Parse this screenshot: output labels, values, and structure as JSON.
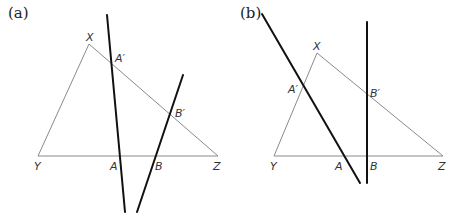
{
  "panels": [
    {
      "id": "a",
      "label": "(a)",
      "label_pos": [
        8,
        18
      ],
      "triangle": {
        "X": [
          89,
          44
        ],
        "Y": [
          38,
          156
        ],
        "Z": [
          218,
          156
        ]
      },
      "lines": [
        {
          "name": "line-through-A-Aprime",
          "from": [
            107,
            15
          ],
          "to": [
            125,
            212
          ]
        },
        {
          "name": "line-through-B-Bprime",
          "from": [
            183,
            75
          ],
          "to": [
            137,
            212
          ]
        }
      ],
      "points": [
        {
          "name": "X",
          "text": "X",
          "pos": [
            86,
            41
          ]
        },
        {
          "name": "Y",
          "text": "Y",
          "pos": [
            34,
            170
          ]
        },
        {
          "name": "Z",
          "text": "Z",
          "pos": [
            213,
            170
          ]
        },
        {
          "name": "A-prime",
          "text": "A′",
          "pos": [
            115,
            62
          ]
        },
        {
          "name": "B-prime",
          "text": "B′",
          "pos": [
            175,
            117
          ]
        },
        {
          "name": "A",
          "text": "A",
          "pos": [
            110,
            170
          ]
        },
        {
          "name": "B",
          "text": "B",
          "pos": [
            155,
            170
          ]
        }
      ]
    },
    {
      "id": "b",
      "label": "(b)",
      "label_pos": [
        240,
        18
      ],
      "triangle": {
        "X": [
          317,
          53
        ],
        "Y": [
          274,
          156
        ],
        "Z": [
          443,
          156
        ]
      },
      "lines": [
        {
          "name": "line-through-A-Aprime",
          "from": [
            262,
            14
          ],
          "to": [
            360,
            183
          ]
        },
        {
          "name": "line-through-B-Bprime",
          "from": [
            367,
            22
          ],
          "to": [
            367,
            183
          ]
        }
      ],
      "points": [
        {
          "name": "X",
          "text": "X",
          "pos": [
            313,
            50
          ]
        },
        {
          "name": "Y",
          "text": "Y",
          "pos": [
            270,
            170
          ]
        },
        {
          "name": "Z",
          "text": "Z",
          "pos": [
            438,
            170
          ]
        },
        {
          "name": "A-prime",
          "text": "A′",
          "pos": [
            288,
            93
          ]
        },
        {
          "name": "B-prime",
          "text": "B′",
          "pos": [
            370,
            97
          ]
        },
        {
          "name": "A",
          "text": "A",
          "pos": [
            335,
            170
          ]
        },
        {
          "name": "B",
          "text": "B",
          "pos": [
            370,
            170
          ]
        }
      ]
    }
  ]
}
